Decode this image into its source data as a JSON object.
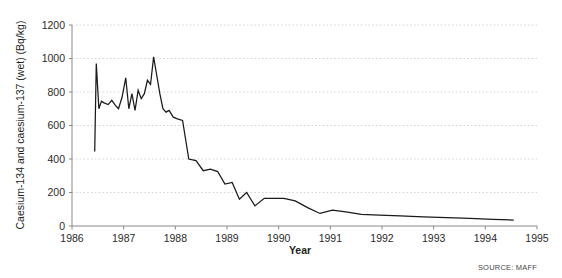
{
  "chart_data": {
    "type": "line",
    "title": "",
    "xlabel": "Year",
    "ylabel": "Caesium-134 and caesium-137 (wet)  (Bq/kg)",
    "xlim": [
      1986,
      1995
    ],
    "ylim": [
      0,
      1200
    ],
    "xticks": [
      1986,
      1987,
      1988,
      1989,
      1990,
      1991,
      1992,
      1993,
      1994,
      1995
    ],
    "xtick_labels": [
      "1986",
      "1987",
      "1988",
      "1989",
      "1990",
      "1991",
      "1992",
      "1993",
      "1994",
      "1995"
    ],
    "yticks": [
      0,
      200,
      400,
      600,
      800,
      1000,
      1200
    ],
    "ytick_labels": [
      "0",
      "200",
      "400",
      "600",
      "800",
      "1000",
      "1200"
    ],
    "grid": "horizontal-dotted",
    "legend": "none",
    "line_color": "#1a1a1a",
    "grid_color": "#c9c9c9",
    "axis_color": "#8a8a8a",
    "source": "SOURCE: MAFF",
    "series": [
      {
        "name": "Caesium-134 and caesium-137 (wet)",
        "x": [
          1986.44,
          1986.47,
          1986.52,
          1986.57,
          1986.62,
          1986.7,
          1986.77,
          1986.84,
          1986.9,
          1986.97,
          1987.04,
          1987.1,
          1987.16,
          1987.22,
          1987.28,
          1987.34,
          1987.4,
          1987.46,
          1987.52,
          1987.58,
          1987.64,
          1987.7,
          1987.76,
          1987.82,
          1987.88,
          1987.96,
          1988.04,
          1988.14,
          1988.26,
          1988.4,
          1988.54,
          1988.68,
          1988.82,
          1988.96,
          1989.1,
          1989.24,
          1989.38,
          1989.54,
          1989.72,
          1989.9,
          1990.1,
          1990.32,
          1990.56,
          1990.8,
          1991.04,
          1991.3,
          1991.6,
          1991.95,
          1992.35,
          1992.8,
          1993.25,
          1993.7,
          1994.15,
          1994.55
        ],
        "y": [
          445,
          970,
          700,
          745,
          735,
          725,
          750,
          720,
          700,
          770,
          885,
          700,
          790,
          690,
          810,
          760,
          790,
          870,
          845,
          1010,
          900,
          790,
          700,
          680,
          690,
          650,
          640,
          630,
          400,
          390,
          330,
          340,
          325,
          250,
          260,
          160,
          200,
          120,
          165,
          165,
          165,
          150,
          110,
          75,
          95,
          85,
          70,
          65,
          60,
          55,
          50,
          45,
          40,
          35
        ]
      }
    ]
  },
  "axis": {
    "y_title": "Caesium-134 and caesium-137 (wet)  (Bq/kg)",
    "x_title": "Year"
  },
  "footer": {
    "source": "SOURCE: MAFF"
  }
}
